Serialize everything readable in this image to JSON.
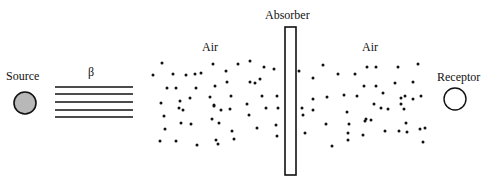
{
  "labels": {
    "source": "Source",
    "beta": "β",
    "air_left": "Air",
    "absorber": "Absorber",
    "air_right": "Air",
    "receptor": "Receptor"
  },
  "colors": {
    "stroke": "#111111",
    "source_fill": "#b8b8b8",
    "background": "#ffffff"
  },
  "source": {
    "cx": 25,
    "cy": 103,
    "r": 11
  },
  "receptor": {
    "cx": 455,
    "cy": 99,
    "r": 11
  },
  "beam_lines": {
    "x1": 55,
    "x2": 133,
    "y": [
      87,
      94,
      102,
      110,
      117
    ]
  },
  "absorber": {
    "x": 285,
    "y": 27,
    "width": 11,
    "height": 148
  },
  "air_particles_left": [
    [
      153,
      75
    ],
    [
      162,
      63
    ],
    [
      161,
      103
    ],
    [
      167,
      88
    ],
    [
      164,
      116
    ],
    [
      165,
      129
    ],
    [
      160,
      141
    ],
    [
      173,
      74
    ],
    [
      176,
      88
    ],
    [
      179,
      108
    ],
    [
      181,
      123
    ],
    [
      176,
      141
    ],
    [
      183,
      110
    ],
    [
      186,
      75
    ],
    [
      195,
      74
    ],
    [
      190,
      98
    ],
    [
      191,
      124
    ],
    [
      197,
      145
    ],
    [
      180,
      101
    ],
    [
      201,
      73
    ],
    [
      196,
      88
    ],
    [
      210,
      97
    ],
    [
      214,
      106
    ],
    [
      216,
      140
    ],
    [
      212,
      119
    ],
    [
      213,
      64
    ],
    [
      215,
      86
    ],
    [
      214,
      105
    ],
    [
      219,
      123
    ],
    [
      221,
      110
    ],
    [
      218,
      144
    ],
    [
      226,
      71
    ],
    [
      227,
      82
    ],
    [
      231,
      96
    ],
    [
      230,
      109
    ],
    [
      232,
      131
    ],
    [
      234,
      139
    ],
    [
      238,
      64
    ],
    [
      250,
      61
    ],
    [
      250,
      82
    ],
    [
      255,
      83
    ],
    [
      260,
      79
    ],
    [
      247,
      104
    ],
    [
      249,
      115
    ],
    [
      257,
      128
    ],
    [
      264,
      67
    ],
    [
      262,
      96
    ],
    [
      266,
      108
    ],
    [
      274,
      69
    ],
    [
      277,
      96
    ],
    [
      278,
      108
    ],
    [
      276,
      125
    ],
    [
      277,
      136
    ]
  ],
  "air_particles_right": [
    [
      299,
      71
    ],
    [
      302,
      108
    ],
    [
      305,
      133
    ],
    [
      303,
      115
    ],
    [
      313,
      78
    ],
    [
      313,
      99
    ],
    [
      313,
      110
    ],
    [
      323,
      65
    ],
    [
      327,
      97
    ],
    [
      326,
      124
    ],
    [
      332,
      146
    ],
    [
      338,
      74
    ],
    [
      344,
      95
    ],
    [
      348,
      140
    ],
    [
      347,
      112
    ],
    [
      349,
      124
    ],
    [
      348,
      133
    ],
    [
      355,
      74
    ],
    [
      357,
      96
    ],
    [
      364,
      86
    ],
    [
      365,
      121
    ],
    [
      366,
      119
    ],
    [
      363,
      135
    ],
    [
      367,
      67
    ],
    [
      376,
      67
    ],
    [
      376,
      86
    ],
    [
      374,
      104
    ],
    [
      371,
      120
    ],
    [
      383,
      93
    ],
    [
      381,
      108
    ],
    [
      385,
      131
    ],
    [
      388,
      109
    ],
    [
      395,
      83
    ],
    [
      398,
      67
    ],
    [
      401,
      98
    ],
    [
      401,
      104
    ],
    [
      399,
      131
    ],
    [
      404,
      109
    ],
    [
      405,
      96
    ],
    [
      406,
      123
    ],
    [
      407,
      132
    ],
    [
      413,
      82
    ],
    [
      413,
      99
    ],
    [
      418,
      64
    ],
    [
      421,
      96
    ],
    [
      420,
      129
    ],
    [
      425,
      128
    ],
    [
      423,
      142
    ]
  ]
}
